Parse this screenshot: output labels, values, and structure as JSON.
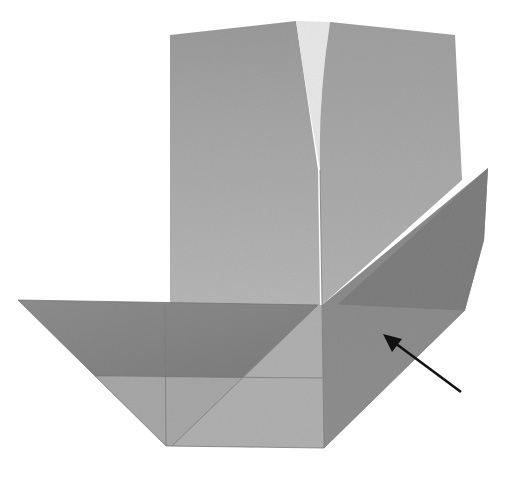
{
  "figure": {
    "description": "Origami folding step photograph with arrow indicating fold location",
    "arrow": {
      "direction": "pointing up-left",
      "color": "#111111"
    },
    "colors": {
      "background": "#ffffff",
      "paper_light": "#b4b4b4",
      "paper_mid": "#9c9c9c",
      "paper_dark": "#858585",
      "crease": "#7a7a7a"
    }
  }
}
